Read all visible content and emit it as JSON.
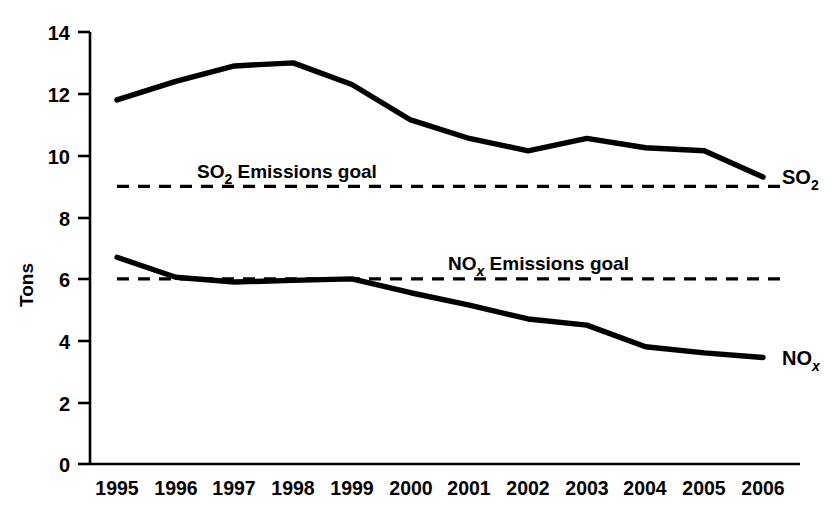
{
  "chart_data": {
    "type": "line",
    "title": "",
    "xlabel": "",
    "ylabel": "Tons",
    "categories": [
      "1995",
      "1996",
      "1997",
      "1998",
      "1999",
      "2000",
      "2001",
      "2002",
      "2003",
      "2004",
      "2005",
      "2006"
    ],
    "x": [
      1995,
      1996,
      1997,
      1998,
      1999,
      2000,
      2001,
      2002,
      2003,
      2004,
      2005,
      2006
    ],
    "ylim": [
      0,
      14
    ],
    "yticks": [
      0,
      2,
      4,
      6,
      8,
      10,
      12,
      14
    ],
    "ytick_labels": [
      "0",
      "2",
      "4",
      "6",
      "8",
      "10",
      "12",
      "14"
    ],
    "grid": false,
    "legend": "inline-right-end-labels",
    "series": [
      {
        "name": "SO2",
        "label_text": "SO",
        "label_sub": "2",
        "style": "solid",
        "color": "#000000",
        "values": [
          11.8,
          12.4,
          12.9,
          13.0,
          12.3,
          11.15,
          10.55,
          10.15,
          10.55,
          10.25,
          10.15,
          9.3
        ]
      },
      {
        "name": "NOx",
        "label_text": "NO",
        "label_sub": "x",
        "style": "solid",
        "color": "#000000",
        "values": [
          6.7,
          6.05,
          5.9,
          5.95,
          6.0,
          5.55,
          5.15,
          4.7,
          4.5,
          3.8,
          3.6,
          3.45
        ]
      }
    ],
    "reference_lines": [
      {
        "name": "SO2 Emissions goal",
        "label_text": "SO",
        "label_sub": "2",
        "label_rest": " Emissions goal",
        "value": 9,
        "style": "dashed",
        "color": "#000000"
      },
      {
        "name": "NOx Emissions goal",
        "label_text": "NO",
        "label_sub": "x",
        "label_rest": " Emissions goal",
        "value": 6,
        "style": "dashed",
        "color": "#000000"
      }
    ],
    "annotations": [
      "SO2 Emissions goal",
      "NOx Emissions goal"
    ]
  },
  "axis": {
    "y_title": "Tons",
    "y_labels": [
      "14",
      "12",
      "10",
      "8",
      "6",
      "4",
      "2",
      "0"
    ],
    "x_labels": [
      "1995",
      "1996",
      "1997",
      "1998",
      "1999",
      "2000",
      "2001",
      "2002",
      "2003",
      "2004",
      "2005",
      "2006"
    ]
  },
  "labels": {
    "so2_goal_main": "SO",
    "so2_goal_sub": "2",
    "so2_goal_rest": " Emissions goal",
    "nox_goal_main": "NO",
    "nox_goal_sub": "x",
    "nox_goal_rest": " Emissions goal",
    "so2_series_main": "SO",
    "so2_series_sub": "2",
    "nox_series_main": "NO",
    "nox_series_sub": "x"
  }
}
